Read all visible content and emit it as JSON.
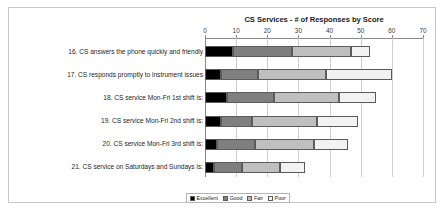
{
  "chart_data": {
    "type": "bar",
    "orientation": "horizontal",
    "stacked": true,
    "title": "CS Services - # of Responses by Score",
    "xlabel": "",
    "ylabel": "",
    "xlim": [
      0,
      70
    ],
    "xticks": [
      0,
      10,
      20,
      30,
      40,
      50,
      60,
      70
    ],
    "grid": true,
    "legend_position": "bottom",
    "categories": [
      "16. CS answers the phone quickly and friendly",
      "17. CS responds promptly to instrument issues",
      "18. CS service Mon-Fri 1st shift is:",
      "19. CS service Mon-Fri 2nd shift is:",
      "20. CS service Mon-Fri 3rd shift is:",
      "21. CS service on Saturdays and Sundays is:"
    ],
    "series": [
      {
        "name": "Excellent",
        "color": "#000000",
        "values": [
          9,
          5,
          7,
          5,
          4,
          3
        ]
      },
      {
        "name": "Good",
        "color": "#7f7f7f",
        "values": [
          19,
          12,
          15,
          10,
          12,
          9
        ]
      },
      {
        "name": "Fair",
        "color": "#bfbfbf",
        "values": [
          19,
          22,
          21,
          21,
          19,
          12
        ]
      },
      {
        "name": "Poor",
        "color": "#f2f2f2",
        "values": [
          6,
          21,
          12,
          13,
          11,
          8
        ]
      }
    ],
    "totals": [
      53,
      60,
      55,
      49,
      46,
      32
    ]
  },
  "axis": {
    "tick_labels": [
      "0",
      "10",
      "20",
      "30",
      "40",
      "50",
      "60",
      "70"
    ]
  },
  "legend": {
    "items": [
      {
        "label": "Excellent",
        "color": "#000000"
      },
      {
        "label": "Good",
        "color": "#7f7f7f"
      },
      {
        "label": "Fair",
        "color": "#bfbfbf"
      },
      {
        "label": "Poor",
        "color": "#f2f2f2"
      }
    ]
  }
}
